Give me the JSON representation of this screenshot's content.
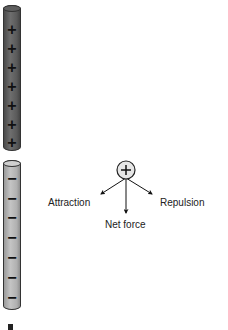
{
  "diagram": {
    "top_rod": {
      "charge": "positive",
      "signs": [
        "+",
        "+",
        "+",
        "+",
        "+",
        "+",
        "+"
      ],
      "color": "#5a5a5a"
    },
    "bottom_rod": {
      "charge": "negative",
      "signs": [
        "−",
        "−",
        "−",
        "−",
        "−",
        "−",
        "−"
      ],
      "color": "#b4b4b4"
    },
    "test_charge": {
      "sign": "+",
      "fill": "#e6e6e6"
    },
    "labels": {
      "attraction": "Attraction",
      "repulsion": "Repulsion",
      "net_force": "Net force"
    }
  }
}
